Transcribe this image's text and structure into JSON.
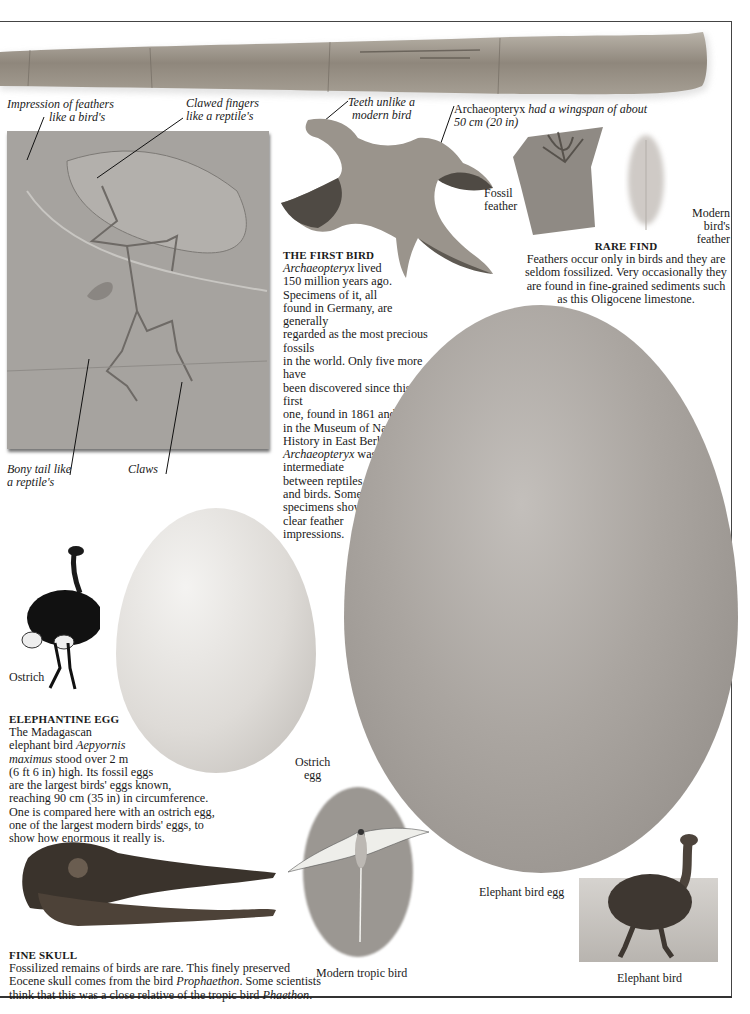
{
  "page": {
    "frame_color": "#444444"
  },
  "bone": {
    "label": "Fossil bone slab"
  },
  "fossil_slab": {
    "callouts": {
      "feathers": [
        "Impression of feathers",
        "like a bird's"
      ],
      "fingers": [
        "Clawed fingers",
        "like a reptile's"
      ],
      "tail": [
        "Bony tail like",
        "a reptile's"
      ],
      "claws": "Claws"
    }
  },
  "model": {
    "callouts": {
      "teeth": [
        "Teeth unlike a",
        "modern bird"
      ],
      "wingspan_name": "Archaeopteryx",
      "wingspan_rest": " had a wingspan of about",
      "wingspan_line2": "50 cm (20 in)"
    }
  },
  "first_bird": {
    "heading": "THE FIRST BIRD",
    "lines": [
      {
        "i": "Archaeopteryx",
        "t": " lived"
      },
      {
        "t": "150 million years ago."
      },
      {
        "t": "Specimens of it, all"
      },
      {
        "t": "found in Germany, are generally"
      },
      {
        "t": "regarded as the most precious fossils"
      },
      {
        "t": "in the world. Only five more have"
      },
      {
        "t": "been discovered since this first"
      },
      {
        "t": "one, found in 1861 and now"
      },
      {
        "t": "in the Museum of Natural"
      },
      {
        "t": "History in East Berlin."
      },
      {
        "i": "Archaeopteryx",
        "t": " was"
      },
      {
        "t": "intermediate"
      },
      {
        "t": "between reptiles"
      },
      {
        "t": "and birds. Some"
      },
      {
        "t": "specimens show"
      },
      {
        "t": "clear feather"
      },
      {
        "t": "impressions."
      }
    ]
  },
  "feathers": {
    "fossil_label": [
      "Fossil",
      "feather"
    ],
    "modern_label": [
      "Modern",
      "bird's",
      "feather"
    ]
  },
  "rare_find": {
    "heading": "RARE FIND",
    "lines": [
      "Feathers occur only in birds and they are",
      "seldom fossilized. Very occasionally they",
      "are found in fine-grained sediments such",
      "as this Oligocene limestone."
    ]
  },
  "ostrich": {
    "label": "Ostrich",
    "egg_label": [
      "Ostrich",
      "egg"
    ]
  },
  "elephantine_egg": {
    "heading": "ELEPHANTINE EGG",
    "lines": [
      {
        "t": "The Madagascan"
      },
      {
        "t": "elephant bird ",
        "i": "Aepyornis"
      },
      {
        "i": "maximus",
        "t": " stood over 2 m"
      },
      {
        "t": "(6 ft 6 in) high. Its fossil eggs"
      },
      {
        "t": "are the largest birds' eggs known,"
      },
      {
        "t": "reaching 90 cm (35 in) in circumference."
      },
      {
        "t": "One is compared here with an ostrich egg,"
      },
      {
        "t": "one of the largest modern birds' eggs, to"
      },
      {
        "t": "show how enormous it really is."
      }
    ]
  },
  "elephant_bird": {
    "egg_label": "Elephant bird egg",
    "label": "Elephant bird"
  },
  "tropic_bird": {
    "label": "Modern tropic bird"
  },
  "fine_skull": {
    "heading": "FINE SKULL",
    "line1": "Fossilized remains of birds are rare. This finely preserved",
    "line2_a": "Eocene skull comes from the bird ",
    "line2_i": "Prophaethon",
    "line2_b": ". Some scientists",
    "line3_a": "think that this was a close relative of the tropic bird ",
    "line3_i": "Phaethon",
    "line3_b": "."
  }
}
